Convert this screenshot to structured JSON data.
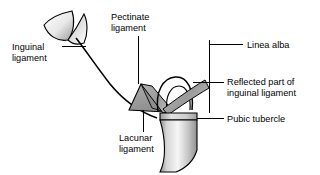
{
  "figure": {
    "background_color": "#ffffff",
    "line_color": "#000000"
  },
  "labels": [
    {
      "id": "inguinal-ligament",
      "line1": "Inguinal",
      "line2": "ligament",
      "text_x": 12,
      "text_y1": 50,
      "text_y2": 61,
      "leader": "M 62 46 L 86 46"
    },
    {
      "id": "pectinate-ligament",
      "line1": "Pectinate",
      "line2": "ligament",
      "text_x": 111,
      "text_y1": 20,
      "text_y2": 31,
      "leader": "M 138 36 L 138 84"
    },
    {
      "id": "linea-alba",
      "line1": "Linea alba",
      "line2": "",
      "text_x": 247,
      "text_y1": 48,
      "text_y2": 0,
      "leader": "M 209 44 L 243 44 M 209 44 L 209 110"
    },
    {
      "id": "reflected-part-of-inguinal-ligament",
      "line1": "Reflected part of",
      "line2": "inguinal ligament",
      "text_x": 227,
      "text_y1": 85,
      "text_y2": 96,
      "leader": "M 195 82 L 224 82"
    },
    {
      "id": "pubic-tubercle",
      "line1": "Pubic tubercle",
      "line2": "",
      "text_x": 227,
      "text_y1": 122,
      "text_y2": 0,
      "leader": "M 196 118 L 224 118"
    },
    {
      "id": "lacunar-ligament",
      "line1": "Lacunar",
      "line2": "ligament",
      "text_x": 119,
      "text_y1": 141,
      "text_y2": 152,
      "leader": "M 143 110 L 143 131"
    }
  ],
  "structures": [
    {
      "id": "inguinal-ligament-cord",
      "kind": "curve",
      "fill": "none",
      "stroke": "#000000"
    },
    {
      "id": "asis-attachment-leaf",
      "kind": "leaf",
      "fill_light": "#ffffff",
      "fill_dark": "#9a9a9a"
    },
    {
      "id": "lacunar-ligament-triangle",
      "kind": "triangle",
      "fill": "#9c9c9c"
    },
    {
      "id": "pectinate-ligament-band",
      "kind": "band",
      "fill": "#a6a6a6"
    },
    {
      "id": "reflected-ligament-band",
      "kind": "band",
      "fill": "#a0a0a0"
    },
    {
      "id": "inguinal-ring-loop",
      "kind": "loop",
      "fill": "none",
      "stroke": "#000000"
    },
    {
      "id": "pubic-bone",
      "kind": "bone",
      "fill_light": "#f2f2f2",
      "fill_mid": "#c8c8c8",
      "fill_dark": "#8c8c8c"
    }
  ],
  "colors": {
    "outline": "#000000",
    "gray_ligament": "#9c9c9c",
    "gray_band": "#a6a6a6",
    "bone_light": "#f4f4f4",
    "bone_mid": "#c9c9c9",
    "bone_dark": "#8a8a8a",
    "background": "#ffffff"
  }
}
